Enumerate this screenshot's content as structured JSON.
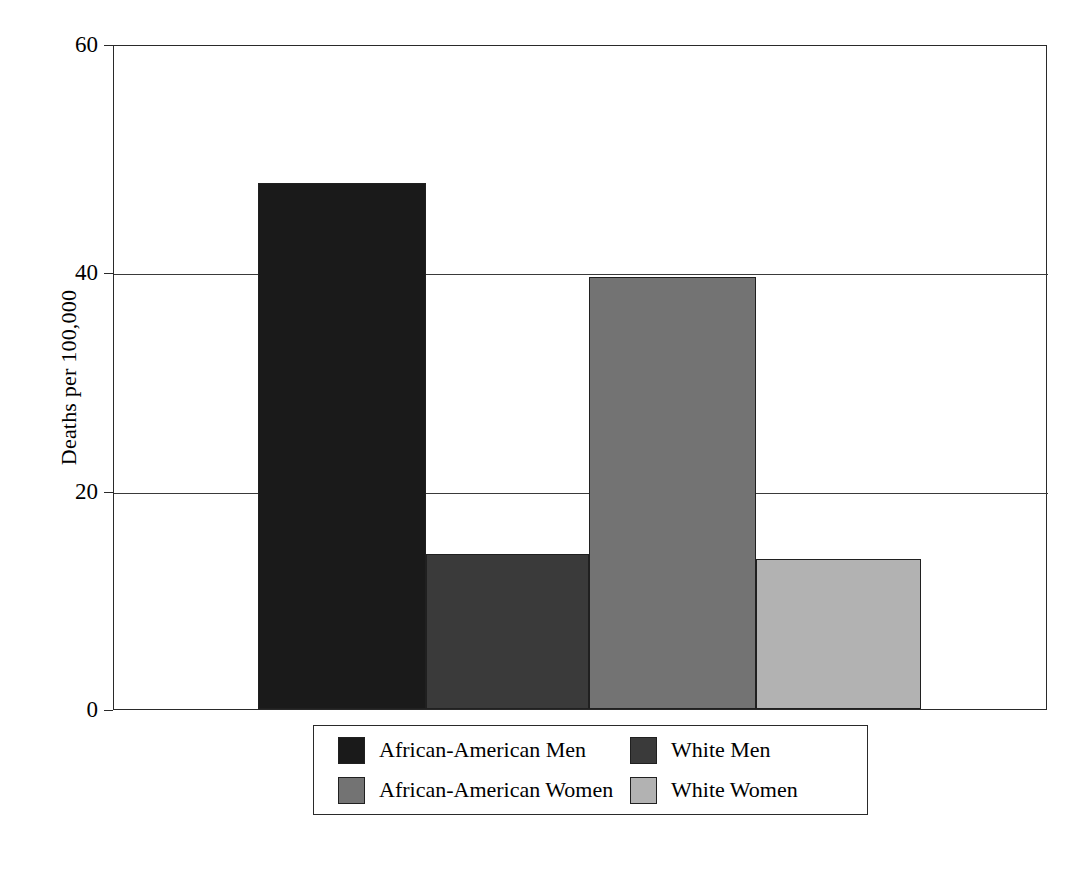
{
  "chart_data": {
    "type": "bar",
    "title": "",
    "subtitle": "",
    "xlabel": "",
    "ylabel": "Deaths per 100,000",
    "categories": [
      "African-American Men",
      "White Men",
      "African-American Women",
      "White Women"
    ],
    "values": [
      47.5,
      14,
      39,
      13.5
    ],
    "series": [
      {
        "name": "Deaths per 100,000",
        "values": [
          47.5,
          14,
          39,
          13.5
        ]
      }
    ],
    "ylim": [
      0,
      60
    ],
    "yticks": [
      0,
      20,
      40,
      60
    ],
    "ytick_labels": [
      "0",
      "20",
      "40",
      "60"
    ],
    "xticks": [],
    "xtick_labels": [],
    "grid": "horizontal",
    "legend_position": "bottom",
    "bar_colors": [
      "#1a1a1a",
      "#3a3a3a",
      "#737373",
      "#b2b2b2"
    ],
    "annotations": []
  },
  "axis": {
    "y_title": "Deaths per 100,000",
    "ticks": [
      {
        "label": "60",
        "value": 60
      },
      {
        "label": "40",
        "value": 40
      },
      {
        "label": "20",
        "value": 20
      },
      {
        "label": "0",
        "value": 0
      }
    ]
  },
  "bars": [
    {
      "label": "African-American Men",
      "value": 47.5,
      "color": "#1a1a1a"
    },
    {
      "label": "White Men",
      "value": 14,
      "color": "#3a3a3a"
    },
    {
      "label": "African-American Women",
      "value": 39,
      "color": "#737373"
    },
    {
      "label": "White Women",
      "value": 13.5,
      "color": "#b2b2b2"
    }
  ],
  "legend": {
    "items": [
      {
        "label": "African-American Men",
        "color": "#1a1a1a"
      },
      {
        "label": "White Men",
        "color": "#3a3a3a"
      },
      {
        "label": "African-American Women",
        "color": "#737373"
      },
      {
        "label": "White Women",
        "color": "#b2b2b2"
      }
    ]
  }
}
